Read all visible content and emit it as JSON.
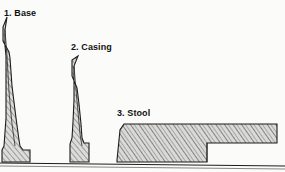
{
  "diagram": {
    "title_visible": false,
    "background_color": "#fbfbfa",
    "ink_color": "#1d1d1d",
    "hatch_color": "#6f6f6f",
    "fill_color": "#d8d8d6",
    "labels": [
      {
        "id": "base",
        "text": "1. Base",
        "x": 4,
        "y": 9
      },
      {
        "id": "casing",
        "text": "2. Casing",
        "x": 71,
        "y": 43
      },
      {
        "id": "stool",
        "text": "3. Stool",
        "x": 117,
        "y": 109
      }
    ],
    "ground_line": {
      "name": "floor-reference-line",
      "x1": 0,
      "y1": 163,
      "x2": 285,
      "y2": 166
    },
    "parts": [
      {
        "id": "base",
        "name": "base-molding-profile",
        "label": "1. Base",
        "description": "tall tapered baseboard molding cross-section",
        "bounds": {
          "x": 1,
          "y": 17,
          "w": 30,
          "h": 145
        },
        "points": "7,17 3,27 3,41 9,52 10,58 12,86 16,118 19,140 20,146 23,150 30,150 30,162 2,162 2,150 4,146 6,118 6,86 6,56 5,46 5,30"
      },
      {
        "id": "casing",
        "name": "casing-molding-profile",
        "label": "2. Casing",
        "description": "medium-height tapered door casing cross-section",
        "bounds": {
          "x": 69,
          "y": 56,
          "w": 23,
          "h": 106
        },
        "points": "78,56 72,60 72,76 77,88 79,104 81,124 82,138 84,143 89,143 89,162 70,162 70,144 72,138 73,122 74,100 74,82 74,66"
      },
      {
        "id": "stool",
        "name": "stool-molding-profile",
        "label": "3. Stool",
        "description": "horizontal window stool cross-section with rabbeted step on right",
        "bounds": {
          "x": 117,
          "y": 124,
          "w": 161,
          "h": 38
        },
        "points": "124,124 120,130 117,160 117,162 207,162 207,143 277,143 277,124"
      }
    ]
  }
}
